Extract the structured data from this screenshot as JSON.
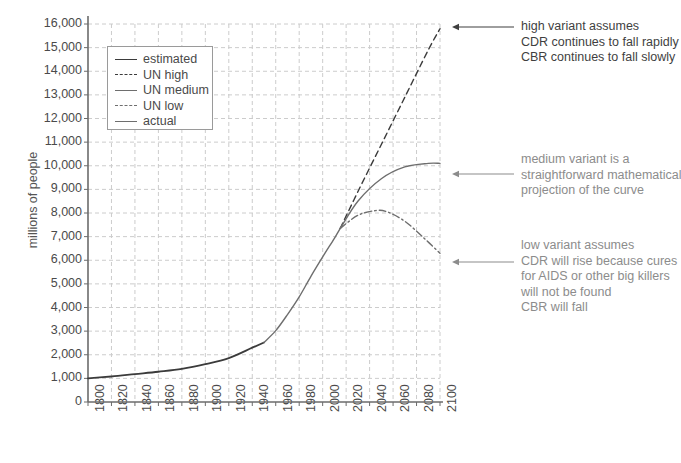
{
  "chart_data": {
    "type": "line",
    "title": "",
    "xlabel": "",
    "ylabel": "millions of people",
    "xlim": [
      1800,
      2100
    ],
    "ylim": [
      0,
      16000
    ],
    "grid": true,
    "legend_position": "top-left",
    "x_ticks": [
      "1800",
      "1820",
      "1840",
      "1860",
      "1880",
      "1900",
      "1920",
      "1940",
      "1960",
      "1980",
      "2000",
      "2020",
      "2040",
      "2060",
      "2080",
      "2100"
    ],
    "y_ticks": [
      "0",
      "1,000",
      "2,000",
      "3,000",
      "4,000",
      "5,000",
      "6,000",
      "7,000",
      "8,000",
      "9,000",
      "10,000",
      "11,000",
      "12,000",
      "13,000",
      "14,000",
      "15,000",
      "16,000"
    ],
    "series": [
      {
        "name": "estimated",
        "style": "solid-dark",
        "color": "#3b3b3b",
        "x": [
          1800,
          1820,
          1840,
          1860,
          1880,
          1900,
          1920,
          1940,
          1950
        ],
        "values": [
          1000,
          1080,
          1180,
          1280,
          1400,
          1600,
          1860,
          2300,
          2520
        ]
      },
      {
        "name": "actual",
        "style": "solid",
        "color": "#6e6e6e",
        "x": [
          1950,
          1960,
          1970,
          1980,
          1990,
          2000,
          2010,
          2015
        ],
        "values": [
          2520,
          3020,
          3700,
          4450,
          5320,
          6140,
          6930,
          7350
        ]
      },
      {
        "name": "UN high",
        "style": "dashed",
        "color": "#3b3b3b",
        "x": [
          2015,
          2030,
          2050,
          2070,
          2090,
          2100
        ],
        "values": [
          7350,
          8900,
          10900,
          12900,
          14900,
          15800
        ]
      },
      {
        "name": "UN medium",
        "style": "solid",
        "color": "#6e6e6e",
        "x": [
          2015,
          2030,
          2050,
          2070,
          2090,
          2100
        ],
        "values": [
          7350,
          8500,
          9450,
          9950,
          10100,
          10100
        ]
      },
      {
        "name": "UN low",
        "style": "dash-dot",
        "color": "#6e6e6e",
        "x": [
          2015,
          2030,
          2045,
          2055,
          2070,
          2085,
          2100
        ],
        "values": [
          7350,
          7900,
          8100,
          8050,
          7650,
          7000,
          6300
        ]
      }
    ]
  },
  "legend": {
    "items": [
      {
        "label": "estimated"
      },
      {
        "label": "UN high"
      },
      {
        "label": "UN medium"
      },
      {
        "label": "UN low"
      },
      {
        "label": "actual"
      }
    ]
  },
  "annotations": {
    "high": [
      "high variant assumes",
      "CDR continues to fall rapidly",
      "CBR continues to fall slowly"
    ],
    "medium": [
      "medium variant is a",
      "straightforward mathematical",
      "projection of the curve"
    ],
    "low": [
      "low variant assumes",
      "CDR will rise because cures",
      "for AIDS or other big killers",
      "will not be found",
      "CBR will fall"
    ]
  },
  "colors": {
    "axis": "#6b6b6b",
    "grid": "#cccccc",
    "dark_line": "#3b3b3b",
    "med_line": "#6e6e6e",
    "anno_gray": "#8c8c8c",
    "anno_dark": "#3f3f3f"
  }
}
